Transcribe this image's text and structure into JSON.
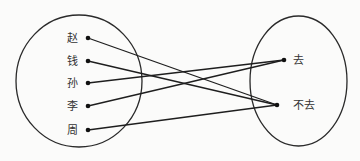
{
  "diagram": {
    "type": "mapping",
    "domain_set": {
      "elements": [
        "赵",
        "钱",
        "孙",
        "李",
        "周"
      ]
    },
    "codomain_set": {
      "elements": [
        "去",
        "不去"
      ]
    },
    "mappings": [
      {
        "from": "赵",
        "to": "不去"
      },
      {
        "from": "钱",
        "to": "不去"
      },
      {
        "from": "孙",
        "to": "去"
      },
      {
        "from": "李",
        "to": "去"
      },
      {
        "from": "周",
        "to": "不去"
      }
    ]
  }
}
